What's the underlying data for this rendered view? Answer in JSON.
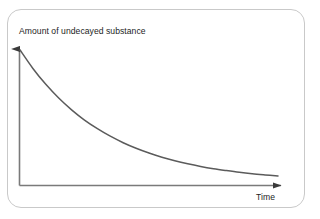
{
  "figure": {
    "type": "line-chart",
    "background_color": "#ffffff",
    "border_color": "#c9c9c9",
    "axis_color": "#6f6f6f",
    "curve_color": "#5b5b5b",
    "text_color": "#1d1d1d"
  },
  "labels": {
    "y_axis": "Amount of undecayed substance",
    "x_axis": "Time"
  },
  "chart_data": {
    "type": "line",
    "title": "",
    "xlabel": "Time",
    "ylabel": "Amount of undecayed substance",
    "grid": false,
    "legend": null,
    "xlim": [
      0,
      1
    ],
    "ylim": [
      0,
      1
    ],
    "axis_ticks": {
      "x": [],
      "y": []
    },
    "series": [
      {
        "name": "undecayed substance",
        "x": [
          0.0,
          0.05,
          0.1,
          0.15,
          0.2,
          0.25,
          0.3,
          0.35,
          0.4,
          0.45,
          0.5,
          0.55,
          0.6,
          0.65,
          0.7,
          0.75,
          0.8,
          0.85,
          0.9,
          0.95,
          1.0
        ],
        "y": [
          1.0,
          0.861,
          0.741,
          0.638,
          0.549,
          0.472,
          0.407,
          0.35,
          0.301,
          0.259,
          0.223,
          0.192,
          0.165,
          0.142,
          0.122,
          0.105,
          0.091,
          0.078,
          0.067,
          0.058,
          0.05
        ]
      }
    ]
  },
  "geometry": {
    "origin_x": 19,
    "origin_y": 185,
    "y_axis_top": 40,
    "x_axis_right": 290,
    "curve_start_y": 50,
    "curve_end_x": 278,
    "curve_end_y": 176
  }
}
